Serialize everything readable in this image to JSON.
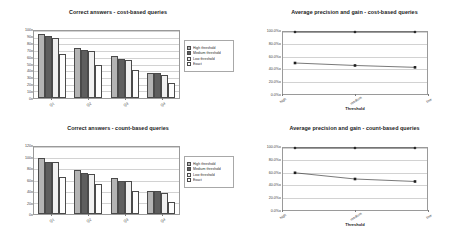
{
  "chart_data": [
    {
      "id": "top-left",
      "type": "bar",
      "title": "Correct answers - cost-based queries",
      "xlabel": "",
      "ylabel": "",
      "categories": [
        "Q1",
        "Q2",
        "Q3",
        "Q4"
      ],
      "ylim": [
        0,
        100
      ],
      "yticks": [
        0,
        10,
        20,
        30,
        40,
        50,
        60,
        70,
        80,
        90,
        100
      ],
      "ytick_labels": [
        "0",
        "10",
        "20",
        "30",
        "40",
        "50",
        "60",
        "70",
        "80",
        "90",
        "100"
      ],
      "grid": true,
      "legend_position": "right",
      "series": [
        {
          "name": "High threshold",
          "color": "#b4b4b4",
          "values": [
            95,
            75,
            62,
            38
          ]
        },
        {
          "name": "Medium threshold",
          "color": "#5e5e5e",
          "values": [
            93,
            72,
            58,
            37
          ]
        },
        {
          "name": "Low threshold",
          "color": "#f0f0f0",
          "values": [
            89,
            70,
            57,
            35
          ]
        },
        {
          "name": "Exact",
          "color": "#fdfdfd",
          "values": [
            65,
            49,
            42,
            23
          ]
        }
      ]
    },
    {
      "id": "top-right",
      "type": "line",
      "title": "Average precision and gain - cost-based queries",
      "xlabel": "Threshold",
      "ylabel": "",
      "categories": [
        "high",
        "medium",
        "low"
      ],
      "ylim": [
        0,
        100
      ],
      "yticks": [
        0,
        20,
        40,
        60,
        80,
        100
      ],
      "ytick_labels": [
        "0.0%",
        "20.0%",
        "40.0%",
        "60.0%",
        "80.0%",
        "100.0%"
      ],
      "grid": true,
      "legend_position": "right",
      "series": [
        {
          "name": "Precision",
          "marker": "diamond",
          "color": "#1f1f1f",
          "values": [
            100,
            100,
            100
          ]
        },
        {
          "name": "Gain",
          "marker": "square",
          "color": "#1f1f1f",
          "values": [
            50,
            46,
            43
          ]
        }
      ]
    },
    {
      "id": "bottom-left",
      "type": "bar",
      "title": "Correct answers - count-based queries",
      "xlabel": "",
      "ylabel": "",
      "categories": [
        "Q1",
        "Q2",
        "Q3",
        "Q4"
      ],
      "ylim": [
        0,
        120
      ],
      "yticks": [
        0,
        20,
        40,
        60,
        80,
        100,
        120
      ],
      "ytick_labels": [
        "0",
        "20",
        "40",
        "60",
        "80",
        "100",
        "120"
      ],
      "grid": true,
      "legend_position": "right",
      "series": [
        {
          "name": "High threshold",
          "color": "#b4b4b4",
          "values": [
            100,
            79,
            65,
            42
          ]
        },
        {
          "name": "Medium threshold",
          "color": "#5e5e5e",
          "values": [
            94,
            73,
            60,
            41
          ]
        },
        {
          "name": "Low threshold",
          "color": "#f0f0f0",
          "values": [
            93,
            71,
            59,
            38
          ]
        },
        {
          "name": "Exact",
          "color": "#fdfdfd",
          "values": [
            67,
            54,
            41,
            22
          ]
        }
      ]
    },
    {
      "id": "bottom-right",
      "type": "line",
      "title": "Average precision and gain - count-based queries",
      "xlabel": "Threshold",
      "ylabel": "",
      "categories": [
        "high",
        "medium",
        "low"
      ],
      "ylim": [
        0,
        100
      ],
      "yticks": [
        0,
        20,
        40,
        60,
        80,
        100
      ],
      "ytick_labels": [
        "0.0%",
        "20.0%",
        "40.0%",
        "60.0%",
        "80.0%",
        "100.0%"
      ],
      "grid": true,
      "legend_position": "right",
      "series": [
        {
          "name": "Precision",
          "marker": "diamond",
          "color": "#1f1f1f",
          "values": [
            100,
            100,
            100
          ]
        },
        {
          "name": "Gain",
          "marker": "square",
          "color": "#1f1f1f",
          "values": [
            60,
            50,
            46
          ]
        }
      ]
    }
  ]
}
